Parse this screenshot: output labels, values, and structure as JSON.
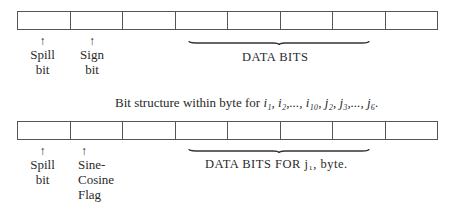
{
  "diagram_1": {
    "cells": 8,
    "labels": {
      "spill": {
        "line1": "Spill",
        "line2": "bit"
      },
      "sign": {
        "line1": "Sign",
        "line2": "bit"
      }
    },
    "arrow": "↑",
    "data_bits_label": "DATA BITS"
  },
  "caption": {
    "prefix": "Bit structure within byte for ",
    "vars": "i₁, i₂,..., i₁₀, j₂, j₃,..., j₆."
  },
  "diagram_2": {
    "cells": 8,
    "labels": {
      "spill": {
        "line1": "Spill",
        "line2": "bit"
      },
      "flag": {
        "line1": "Sine-",
        "line2": "Cosine",
        "line3": "Flag"
      }
    },
    "arrow": "↑",
    "data_bits_label": "DATA BITS FOR j₁, byte."
  },
  "colors": {
    "line": "#555555",
    "text": "#2a2a2a",
    "background": "#ffffff"
  }
}
